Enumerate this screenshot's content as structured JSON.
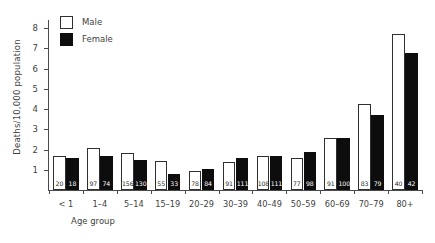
{
  "chart_data": {
    "type": "bar",
    "title": "",
    "xlabel": "Age group",
    "ylabel": "Deaths/10,000 population",
    "ylim": [
      0,
      8.4
    ],
    "yticks": [
      1,
      2,
      3,
      4,
      5,
      6,
      7,
      8
    ],
    "ytick_labels": [
      "1",
      "2",
      "3",
      "4",
      "5",
      "6",
      "7",
      "8"
    ],
    "grid": false,
    "legend_position": "top-left",
    "categories": [
      "< 1",
      "1–4",
      "5–14",
      "15–19",
      "20–29",
      "30–39",
      "40–49",
      "50–59",
      "60–69",
      "70–79",
      "80+"
    ],
    "series": [
      {
        "name": "Male",
        "color": "#ffffff",
        "edge_color": "#2f2f2f",
        "values": [
          1.7,
          2.07,
          1.85,
          1.42,
          0.92,
          1.36,
          1.66,
          1.58,
          2.55,
          4.25,
          7.72
        ],
        "counts": [
          "20",
          "97",
          "156",
          "55",
          "78",
          "91",
          "108",
          "77",
          "91",
          "83",
          "40"
        ]
      },
      {
        "name": "Female",
        "color": "#0d0d0d",
        "edge_color": "#0d0d0d",
        "values": [
          1.6,
          1.66,
          1.5,
          0.8,
          1.04,
          1.6,
          1.68,
          1.88,
          2.56,
          3.7,
          6.78
        ],
        "counts": [
          "18",
          "74",
          "130",
          "33",
          "84",
          "111",
          "111",
          "98",
          "100",
          "79",
          "42"
        ]
      }
    ]
  },
  "legend": {
    "items": [
      {
        "label": "Male",
        "key": "male"
      },
      {
        "label": "Female",
        "key": "female"
      }
    ]
  }
}
